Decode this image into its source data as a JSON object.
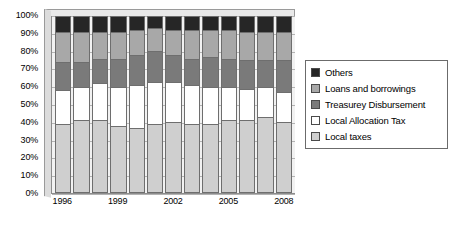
{
  "chart_data": {
    "type": "bar",
    "subtype": "100% stacked column",
    "title": "",
    "xlabel": "",
    "ylabel": "",
    "ylim": [
      0,
      100
    ],
    "yticks": [
      "0%",
      "10%",
      "20%",
      "30%",
      "40%",
      "50%",
      "60%",
      "70%",
      "80%",
      "90%",
      "100%"
    ],
    "grid": true,
    "legend_position": "right",
    "categories": [
      "1996",
      "1997",
      "1998",
      "1999",
      "2000",
      "2001",
      "2002",
      "2003",
      "2004",
      "2005",
      "2006",
      "2007",
      "2008"
    ],
    "xtick_labels": [
      "1996",
      "1999",
      "2002",
      "2005",
      "2008"
    ],
    "xtick_categories": [
      "1996",
      "1999",
      "2002",
      "2005",
      "2008"
    ],
    "stack_order_bottom_to_top": [
      "Local taxes",
      "Local Allocation Tax",
      "Treasurey Disbursement",
      "Loans and borrowings",
      "Others"
    ],
    "series": [
      {
        "name": "Local taxes",
        "color": "#cfcfcf",
        "values": [
          39,
          41,
          41,
          38,
          37,
          39,
          40,
          39,
          39,
          41,
          41,
          43,
          40
        ]
      },
      {
        "name": "Local Allocation Tax",
        "color": "#ffffff",
        "values": [
          19,
          19,
          21,
          22,
          24,
          24,
          23,
          22,
          21,
          19,
          18,
          17,
          17
        ]
      },
      {
        "name": "Treasurey Disbursement",
        "color": "#7a7a7a",
        "values": [
          16,
          14,
          14,
          16,
          17,
          17,
          15,
          15,
          17,
          16,
          16,
          15,
          18
        ]
      },
      {
        "name": "Loans and borrowings",
        "color": "#a8a8a8",
        "values": [
          17,
          17,
          15,
          15,
          14,
          13,
          14,
          16,
          15,
          16,
          16,
          16,
          16
        ]
      },
      {
        "name": "Others",
        "color": "#262626",
        "values": [
          9,
          9,
          9,
          9,
          8,
          7,
          8,
          8,
          8,
          8,
          9,
          9,
          9
        ]
      }
    ]
  },
  "legend": {
    "items": [
      {
        "label": "Others",
        "color": "#262626",
        "swatch_name": "legend-swatch-others"
      },
      {
        "label": "Loans and borrowings",
        "color": "#a8a8a8",
        "swatch_name": "legend-swatch-loans-and-borrowings"
      },
      {
        "label": "Treasurey Disbursement",
        "color": "#7a7a7a",
        "swatch_name": "legend-swatch-treasurey-disbursement"
      },
      {
        "label": "Local Allocation Tax",
        "color": "#ffffff",
        "swatch_name": "legend-swatch-local-allocation-tax"
      },
      {
        "label": "Local taxes",
        "color": "#cfcfcf",
        "swatch_name": "legend-swatch-local-taxes"
      }
    ]
  }
}
